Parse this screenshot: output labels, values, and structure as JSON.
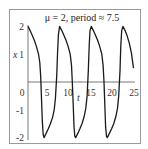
{
  "chart_data": {
    "type": "line",
    "title": "μ = 2, period ≈ 7.5",
    "xlabel": "t",
    "ylabel": "x",
    "xlim": [
      0,
      25
    ],
    "ylim": [
      -2,
      2
    ],
    "x_ticks": [
      "0",
      "5",
      "10",
      "15",
      "20",
      "25"
    ],
    "y_ticks": [
      "2",
      "1",
      "-1",
      "-2"
    ],
    "grid": false,
    "legend": null,
    "series": [
      {
        "name": "x(t)",
        "period": 7.5,
        "t": [
          0,
          0.5,
          1.0,
          1.5,
          2.0,
          2.5,
          2.8,
          3.0,
          3.2,
          3.4,
          3.6,
          3.8,
          4.3,
          4.8,
          5.3,
          5.8,
          6.2,
          6.5,
          6.8,
          7.0,
          7.2,
          7.5,
          8.0,
          8.5,
          9.0,
          9.5,
          10.0,
          10.3,
          10.5,
          10.7,
          10.9,
          11.1,
          11.3,
          11.8,
          12.3,
          12.8,
          13.3,
          13.7,
          14.0,
          14.3,
          14.5,
          14.7,
          15.0,
          15.5,
          16.0,
          16.5,
          17.0,
          17.5,
          17.8,
          18.0,
          18.2,
          18.4,
          18.6,
          18.8,
          19.3,
          19.8,
          20.3,
          20.8,
          21.2,
          21.5,
          21.8,
          22.0,
          22.2,
          22.5,
          23.0,
          23.5,
          24.0,
          24.5,
          25.0
        ],
        "x": [
          2.0,
          1.85,
          1.68,
          1.5,
          1.28,
          1.0,
          0.7,
          0.2,
          -0.6,
          -1.4,
          -1.9,
          -2.0,
          -1.85,
          -1.68,
          -1.5,
          -1.28,
          -1.0,
          -0.6,
          0.2,
          1.0,
          1.7,
          2.0,
          1.85,
          1.68,
          1.5,
          1.28,
          1.0,
          0.6,
          0.0,
          -0.8,
          -1.6,
          -1.95,
          -2.0,
          -1.85,
          -1.68,
          -1.5,
          -1.25,
          -0.95,
          -0.5,
          0.4,
          1.3,
          1.85,
          2.0,
          1.85,
          1.68,
          1.5,
          1.28,
          1.0,
          0.6,
          0.0,
          -0.8,
          -1.6,
          -1.95,
          -2.0,
          -1.85,
          -1.68,
          -1.5,
          -1.25,
          -0.95,
          -0.5,
          0.4,
          1.3,
          1.85,
          2.0,
          1.85,
          1.65,
          1.4,
          1.05,
          0.5
        ]
      }
    ]
  }
}
